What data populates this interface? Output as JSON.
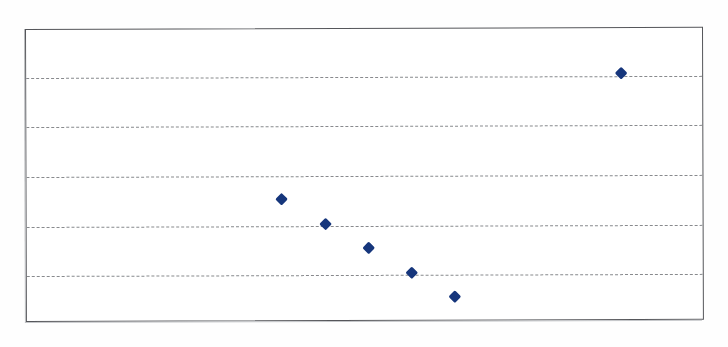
{
  "figure": {
    "kind": "scanned-scatter-figure",
    "background_color": "#ffffff",
    "frame_color": "#55565a",
    "marker_color": "#16367c",
    "gridline_color": "#7e8084",
    "plot_area": {
      "left": 25,
      "top": 29,
      "width": 678,
      "height": 293
    },
    "gridlines_y_px": [
      48,
      97,
      147,
      197,
      246
    ],
    "marker_shape": "diamond",
    "marker_size_px": 9
  },
  "chart_data": {
    "type": "scatter",
    "title": "",
    "subtitle": "",
    "xlabel": "",
    "ylabel": "",
    "grid": true,
    "grid_axis": "y",
    "legend": false,
    "legend_position": "none",
    "xtick_labels": [],
    "ytick_labels": [],
    "xlim": [
      0,
      10
    ],
    "ylim": [
      0,
      6
    ],
    "yticks": [
      1,
      2,
      3,
      4,
      5
    ],
    "annotations": [],
    "series": [
      {
        "name": "series-1",
        "marker": "diamond",
        "color": "#16367c",
        "x": [
          3.75,
          4.25,
          4.75,
          5.2,
          5.65,
          8.5
        ],
        "y": [
          2.5,
          2.0,
          1.5,
          1.0,
          0.55,
          5.0
        ],
        "points_px": [
          {
            "x": 280,
            "y": 199
          },
          {
            "x": 324,
            "y": 224
          },
          {
            "x": 367,
            "y": 248
          },
          {
            "x": 410,
            "y": 273
          },
          {
            "x": 453,
            "y": 297
          },
          {
            "x": 620,
            "y": 74
          }
        ]
      }
    ]
  }
}
